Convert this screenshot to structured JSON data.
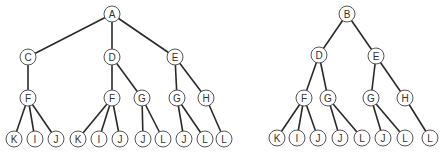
{
  "diagram": {
    "type": "tree-diagram",
    "node_radius": 8,
    "colors": {
      "edge": "#2a2a2a",
      "node_stroke": "#555555",
      "node_fill": "#ffffff",
      "label": "#333333"
    },
    "trees": [
      {
        "name": "left-tree",
        "root": "A",
        "nodes": [
          {
            "id": "A",
            "label": "A",
            "x": 112,
            "y": 14
          },
          {
            "id": "C",
            "label": "C",
            "x": 28,
            "y": 57
          },
          {
            "id": "D",
            "label": "D",
            "x": 112,
            "y": 57
          },
          {
            "id": "E",
            "label": "E",
            "x": 175,
            "y": 57
          },
          {
            "id": "F1",
            "label": "F",
            "x": 28,
            "y": 98
          },
          {
            "id": "F2",
            "label": "F",
            "x": 112,
            "y": 98
          },
          {
            "id": "G1",
            "label": "G",
            "x": 142,
            "y": 98
          },
          {
            "id": "G2",
            "label": "G",
            "x": 177,
            "y": 98
          },
          {
            "id": "H",
            "label": "H",
            "x": 206,
            "y": 98
          },
          {
            "id": "K1",
            "label": "K",
            "x": 14,
            "y": 139
          },
          {
            "id": "I1",
            "label": "I",
            "x": 35,
            "y": 139
          },
          {
            "id": "J1",
            "label": "J",
            "x": 56,
            "y": 139
          },
          {
            "id": "K2",
            "label": "K",
            "x": 78,
            "y": 139
          },
          {
            "id": "I2",
            "label": "I",
            "x": 99,
            "y": 139
          },
          {
            "id": "J2",
            "label": "J",
            "x": 120,
            "y": 139
          },
          {
            "id": "J3",
            "label": "J",
            "x": 143,
            "y": 139
          },
          {
            "id": "L1",
            "label": "L",
            "x": 163,
            "y": 139
          },
          {
            "id": "J4",
            "label": "J",
            "x": 184,
            "y": 139
          },
          {
            "id": "L2",
            "label": "L",
            "x": 205,
            "y": 139
          },
          {
            "id": "L3",
            "label": "L",
            "x": 224,
            "y": 139
          }
        ],
        "edges": [
          [
            "A",
            "C"
          ],
          [
            "A",
            "D"
          ],
          [
            "A",
            "E"
          ],
          [
            "C",
            "F1"
          ],
          [
            "D",
            "F2"
          ],
          [
            "D",
            "G1"
          ],
          [
            "E",
            "G2"
          ],
          [
            "E",
            "H"
          ],
          [
            "F1",
            "K1"
          ],
          [
            "F1",
            "I1"
          ],
          [
            "F1",
            "J1"
          ],
          [
            "F2",
            "K2"
          ],
          [
            "F2",
            "I2"
          ],
          [
            "F2",
            "J2"
          ],
          [
            "G1",
            "J3"
          ],
          [
            "G1",
            "L1"
          ],
          [
            "G2",
            "J4"
          ],
          [
            "G2",
            "L2"
          ],
          [
            "H",
            "L3"
          ]
        ]
      },
      {
        "name": "right-tree",
        "root": "B",
        "nodes": [
          {
            "id": "B",
            "label": "B",
            "x": 347,
            "y": 14
          },
          {
            "id": "D",
            "label": "D",
            "x": 319,
            "y": 55
          },
          {
            "id": "E",
            "label": "E",
            "x": 376,
            "y": 56
          },
          {
            "id": "F",
            "label": "F",
            "x": 304,
            "y": 98
          },
          {
            "id": "G1",
            "label": "G",
            "x": 328,
            "y": 98
          },
          {
            "id": "G2",
            "label": "G",
            "x": 371,
            "y": 98
          },
          {
            "id": "H",
            "label": "H",
            "x": 405,
            "y": 98
          },
          {
            "id": "K",
            "label": "K",
            "x": 277,
            "y": 138
          },
          {
            "id": "I",
            "label": "I",
            "x": 297,
            "y": 138
          },
          {
            "id": "J1",
            "label": "J",
            "x": 318,
            "y": 138
          },
          {
            "id": "J2",
            "label": "J",
            "x": 340,
            "y": 138
          },
          {
            "id": "L1",
            "label": "L",
            "x": 362,
            "y": 138
          },
          {
            "id": "J3",
            "label": "J",
            "x": 383,
            "y": 138
          },
          {
            "id": "L2",
            "label": "L",
            "x": 405,
            "y": 138
          },
          {
            "id": "L3",
            "label": "L",
            "x": 430,
            "y": 138
          }
        ],
        "edges": [
          [
            "B",
            "D"
          ],
          [
            "B",
            "E"
          ],
          [
            "D",
            "F"
          ],
          [
            "D",
            "G1"
          ],
          [
            "E",
            "G2"
          ],
          [
            "E",
            "H"
          ],
          [
            "F",
            "K"
          ],
          [
            "F",
            "I"
          ],
          [
            "F",
            "J1"
          ],
          [
            "G1",
            "J2"
          ],
          [
            "G1",
            "L1"
          ],
          [
            "G2",
            "J3"
          ],
          [
            "G2",
            "L2"
          ],
          [
            "H",
            "L3"
          ]
        ]
      }
    ]
  }
}
